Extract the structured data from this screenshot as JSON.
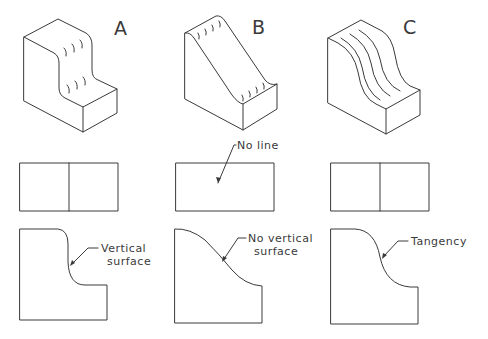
{
  "figure": {
    "columns": [
      {
        "id": "A",
        "label": "A",
        "front_view": {
          "has_center_line": true
        },
        "top_view": {
          "annotation_line1": "Vertical",
          "annotation_line2": "surface"
        }
      },
      {
        "id": "B",
        "label": "B",
        "front_view": {
          "has_center_line": false,
          "annotation": "No line"
        },
        "top_view": {
          "annotation_line1": "No vertical",
          "annotation_line2": "surface"
        }
      },
      {
        "id": "C",
        "label": "C",
        "front_view": {
          "has_center_line": true
        },
        "top_view": {
          "annotation_line1": "Tangency",
          "annotation_line2": ""
        }
      }
    ],
    "colors": {
      "line": "#3a3a3a",
      "background": "#ffffff"
    }
  }
}
